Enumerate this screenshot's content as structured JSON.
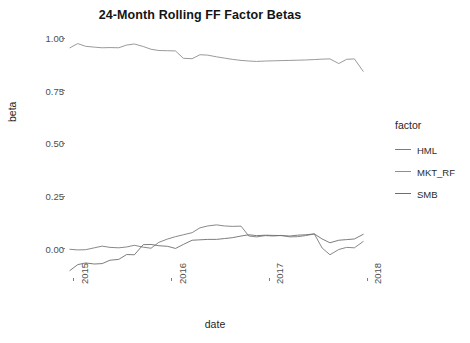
{
  "chart_data": {
    "type": "line",
    "title": "24-Month Rolling FF Factor Betas",
    "xlabel": "date",
    "ylabel": "beta",
    "legend_title": "factor",
    "legend_position": "right",
    "grid": false,
    "xlim": [
      2014.92,
      2018.05
    ],
    "ylim": [
      -0.13,
      1.03
    ],
    "xticks": [
      "2015",
      "2016",
      "2017",
      "2018"
    ],
    "xtick_values": [
      2015,
      2016,
      2017,
      2018
    ],
    "yticks": [
      "0.00",
      "0.25",
      "0.50",
      "0.75",
      "1.00"
    ],
    "ytick_values": [
      0.0,
      0.25,
      0.5,
      0.75,
      1.0
    ],
    "x": [
      2014.96,
      2015.04,
      2015.12,
      2015.21,
      2015.29,
      2015.37,
      2015.46,
      2015.54,
      2015.62,
      2015.71,
      2015.79,
      2015.87,
      2015.96,
      2016.04,
      2016.12,
      2016.21,
      2016.29,
      2016.37,
      2016.46,
      2016.54,
      2016.62,
      2016.71,
      2016.79,
      2016.87,
      2016.96,
      2017.04,
      2017.12,
      2017.21,
      2017.29,
      2017.37,
      2017.46,
      2017.54,
      2017.62,
      2017.71,
      2017.79,
      2017.87,
      2017.96
    ],
    "series": [
      {
        "name": "MKT_RF",
        "color": "#8f8f8f",
        "values": [
          0.955,
          0.975,
          0.962,
          0.958,
          0.955,
          0.956,
          0.955,
          0.968,
          0.973,
          0.961,
          0.948,
          0.942,
          0.941,
          0.94,
          0.905,
          0.903,
          0.922,
          0.92,
          0.912,
          0.906,
          0.9,
          0.895,
          0.892,
          0.89,
          0.892,
          0.893,
          0.894,
          0.895,
          0.896,
          0.897,
          0.899,
          0.901,
          0.902,
          0.88,
          0.9,
          0.902,
          0.843
        ]
      },
      {
        "name": "HML",
        "color": "#7c7c7c",
        "values": [
          -0.003,
          -0.006,
          -0.005,
          0.004,
          0.012,
          0.006,
          0.004,
          0.008,
          0.016,
          0.007,
          0.002,
          0.03,
          0.046,
          0.057,
          0.066,
          0.076,
          0.099,
          0.108,
          0.113,
          0.108,
          0.106,
          0.107,
          0.06,
          0.056,
          0.062,
          0.06,
          0.063,
          0.056,
          0.057,
          0.062,
          0.07,
          0.003,
          -0.029,
          -0.004,
          0.006,
          0.004,
          0.034
        ]
      },
      {
        "name": "SMB",
        "color": "#6e6e6e",
        "values": [
          -0.104,
          -0.076,
          -0.068,
          -0.073,
          -0.071,
          -0.055,
          -0.051,
          -0.028,
          -0.029,
          0.019,
          0.02,
          0.014,
          0.011,
          0.001,
          0.02,
          0.04,
          0.042,
          0.044,
          0.044,
          0.048,
          0.052,
          0.06,
          0.066,
          0.062,
          0.064,
          0.063,
          0.062,
          0.06,
          0.064,
          0.066,
          0.07,
          0.046,
          0.028,
          0.04,
          0.043,
          0.046,
          0.068
        ]
      }
    ]
  }
}
